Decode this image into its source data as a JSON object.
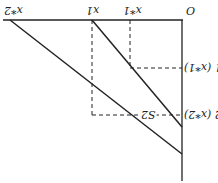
{
  "diagram": {
    "orientation": "rotated 180 degrees",
    "labels": {
      "origin": "O",
      "x1_star": "x*1",
      "x1": "x1",
      "x2_star": "x*2",
      "p1": "p1 (x*1)",
      "p2": "p2 (x*2)",
      "s2": "S2"
    },
    "colors": {
      "line": "#222222",
      "background": "#ffffff"
    }
  }
}
